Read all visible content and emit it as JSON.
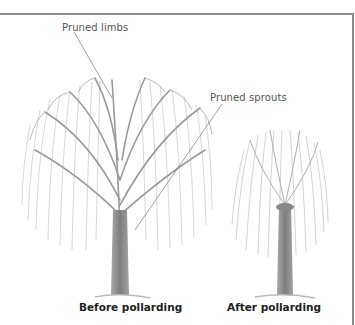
{
  "labels": {
    "pruned_limbs": "Pruned limbs",
    "pruned_sprouts": "Pruned sprouts"
  },
  "captions": {
    "before": "Before pollarding",
    "after": "After pollarding"
  },
  "colors": {
    "frame": "#8a8a8a",
    "trunk": "#8d8d8d",
    "branches": "#9a9a9a",
    "foliage": "#c4c4c4",
    "leader_line": "#777777"
  }
}
